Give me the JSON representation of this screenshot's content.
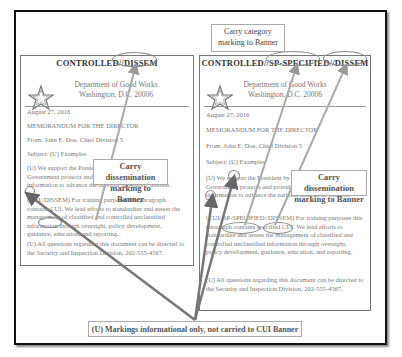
{
  "callouts": {
    "category": [
      "Carry category",
      "marking to Banner"
    ],
    "dissem_left": [
      "Carry dissemination",
      "marking to Banner"
    ],
    "dissem_right": [
      "Carry dissemination",
      "marking to Banner"
    ],
    "bottom": "(U) Markings informational only, not carried to CUI Banner"
  },
  "left_doc": {
    "banner": "CONTROLLED//DISSEM",
    "dept": [
      "Department of Good Works",
      "Washington, D.C. 20006"
    ],
    "date": "August 27, 2016",
    "memo": "MEMORANDUM FOR THE DIRECTOR",
    "from": "From: John E. Doe, Chief Division 5",
    "subject": "Subject: (U) Examples",
    "para1": "(U) We support the President by ensuring that the Government protects and provides proper access to information to advance the national and public interest.",
    "para2": "(CUI//DISSEM) For training purposes this paragraph contains CUI. We lead efforts to standardize and assess the management of classified and controlled unclassified information through oversight, policy development, guidance, education, and reporting.",
    "para3": "(U) All questions regarding this document can be directed to the Security and Inspection Division, 202-555-4567."
  },
  "right_doc": {
    "banner": "CONTROLLED//SP-SPECIFIED//DISSEM",
    "dept": [
      "Department of Good Works",
      "Washington, D.C. 20006"
    ],
    "date": "August 27, 2016",
    "memo": "MEMORANDUM FOR THE DIRECTOR",
    "from": "From: John E. Doe, Chief Division 5",
    "subject": "Subject: (U) Examples",
    "para1": "(U) We support the President by ensuring that the Government protects and provides proper access to information to advance the national and public interest.",
    "para2": "(CUI//SP-SPECIFIED//DISSEM) For training purposes this paragraph contains specified CUI. We lead efforts to standardize and assess the management of classified and controlled unclassified information through oversight, policy development, guidance, education, and reporting.",
    "para3": "(U) All questions regarding this document can be directed to the Security and Inspection Division, 202-555-4567."
  },
  "icons": {
    "seal": "star-seal-icon"
  }
}
